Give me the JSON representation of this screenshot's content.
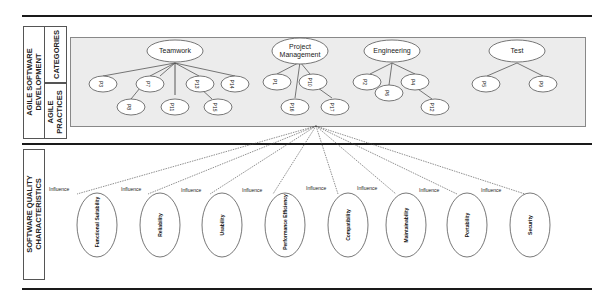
{
  "sections": {
    "agile": {
      "title": "AGILE SOFTWARE DEVELOPMENT",
      "categories_label": "CATEGORIES",
      "practices_label": "AGILE PRACTICES"
    },
    "quality": {
      "title": "SOFTWARE QUALITY CHARACTERISTICS"
    }
  },
  "categories": [
    {
      "name": "Teamwork",
      "practices": [
        "P3",
        "P7",
        "P13",
        "P14",
        "P8",
        "P11",
        "P15"
      ]
    },
    {
      "name": "Project Management",
      "practices": [
        "P1",
        "P10",
        "P16",
        "P17"
      ]
    },
    {
      "name": "Engineering",
      "practices": [
        "P2",
        "P6",
        "P4",
        "P12"
      ]
    },
    {
      "name": "Test",
      "practices": [
        "P5",
        "P9"
      ]
    }
  ],
  "source_practice": "P17",
  "relation_label": "Influence",
  "characteristics": [
    "Functional Suitability",
    "Reliability",
    "Usability",
    "Performance Efficiency",
    "Compatibility",
    "Maintainability",
    "Portability",
    "Security"
  ]
}
